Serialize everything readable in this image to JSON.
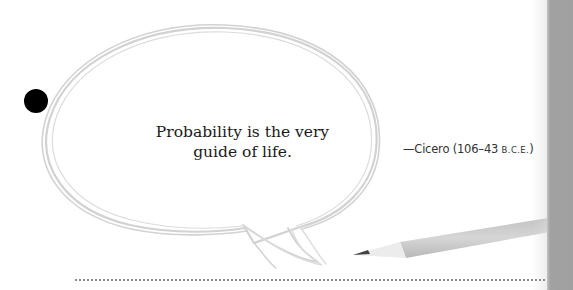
{
  "quote": {
    "line1": "Probability is the very",
    "line2": "guide of life."
  },
  "attribution": {
    "prefix": "—Cicero (106–43 ",
    "era": "B.C.E.",
    "suffix": ")"
  },
  "decor": {
    "bullet_icon": "filled-circle",
    "bubble_icon": "speech-bubble-sketch",
    "pencil_icon": "pencil",
    "colors": {
      "bubble_stroke": "#cfcfcf",
      "side_tab": "#a2a2a2",
      "text": "#1a1a1a",
      "rule": "#8a8a8a"
    }
  }
}
